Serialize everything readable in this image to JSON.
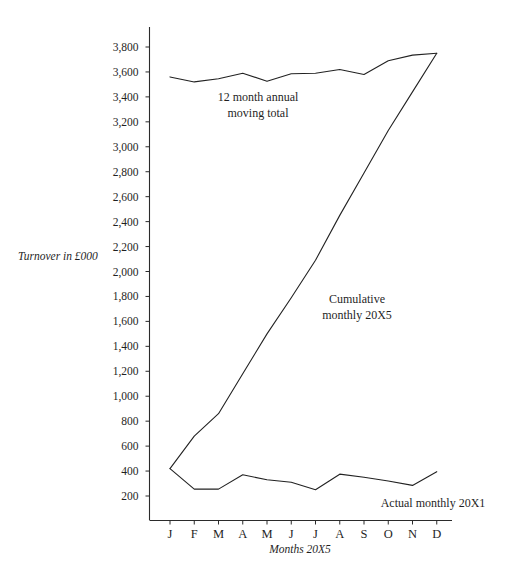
{
  "chart_data": {
    "type": "line",
    "title": "",
    "xlabel": "Months 20X5",
    "ylabel": "Turnover in £000",
    "categories": [
      "J",
      "F",
      "M",
      "A",
      "M",
      "J",
      "J",
      "A",
      "S",
      "O",
      "N",
      "D"
    ],
    "ylim": [
      0,
      3900
    ],
    "ytick_labels": [
      "200",
      "400",
      "600",
      "800",
      "1,000",
      "1,200",
      "1,400",
      "1,600",
      "1,800",
      "2,000",
      "2,200",
      "2,400",
      "2,600",
      "2,800",
      "3,000",
      "3,200",
      "3,400",
      "3,600",
      "3,800"
    ],
    "ytick_values": [
      200,
      400,
      600,
      800,
      1000,
      1200,
      1400,
      1600,
      1800,
      2000,
      2200,
      2400,
      2600,
      2800,
      3000,
      3200,
      3400,
      3600,
      3800
    ],
    "grid": false,
    "legend_position": "inline-annotations",
    "series": [
      {
        "name": "12 month annual moving total",
        "values": [
          3560,
          3520,
          3545,
          3590,
          3525,
          3585,
          3590,
          3620,
          3580,
          3690,
          3735,
          3750
        ]
      },
      {
        "name": "Cumulative monthly 20X5",
        "values": [
          420,
          680,
          860,
          1180,
          1500,
          1790,
          2090,
          2450,
          2790,
          3130,
          3440,
          3750
        ]
      },
      {
        "name": "Actual monthly 20X1",
        "values": [
          420,
          255,
          255,
          370,
          330,
          310,
          250,
          375,
          350,
          320,
          285,
          395
        ]
      }
    ],
    "annotations": [
      {
        "id": "moving-total",
        "text_lines": [
          "12 month annual",
          "moving total"
        ]
      },
      {
        "id": "cumulative",
        "text_lines": [
          "Cumulative",
          "monthly 20X5"
        ]
      },
      {
        "id": "actual-monthly",
        "text_lines": [
          "Actual monthly 20X1"
        ]
      }
    ],
    "colors": {
      "line": "#222222",
      "axis": "#2b2b2b",
      "background": "#ffffff"
    }
  }
}
